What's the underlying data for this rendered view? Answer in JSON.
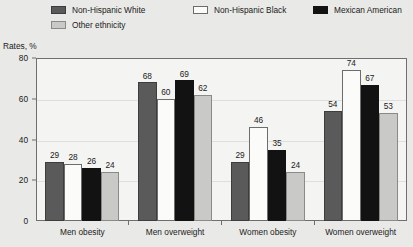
{
  "legend": {
    "items": [
      {
        "label": "Non-Hispanic White",
        "swatch": "dark-gray",
        "color": "#5a5a5a"
      },
      {
        "label": "Non-Hispanic Black",
        "swatch": "white",
        "color": "#fbfbfa"
      },
      {
        "label": "Mexican American",
        "swatch": "black",
        "color": "#121212"
      },
      {
        "label": "Other ethnicity",
        "swatch": "light-gray",
        "color": "#c9c9c7"
      }
    ]
  },
  "axis": {
    "y_title": "Rates, %",
    "y_ticks": [
      "0",
      "20",
      "40",
      "60",
      "80"
    ]
  },
  "chart_data": {
    "type": "bar",
    "title": "",
    "subtitle": "",
    "xlabel": "",
    "ylabel": "Rates, %",
    "ylim": [
      0,
      80
    ],
    "yticks": [
      0,
      20,
      40,
      60,
      80
    ],
    "grid": true,
    "legend_position": "top",
    "categories": [
      "Men obesity",
      "Men overweight",
      "Women obesity",
      "Women overweight"
    ],
    "series": [
      {
        "name": "Non-Hispanic White",
        "color": "#5a5a5a",
        "values": [
          29,
          68,
          29,
          54
        ]
      },
      {
        "name": "Non-Hispanic Black",
        "color": "#fbfbfa",
        "values": [
          28,
          60,
          46,
          74
        ]
      },
      {
        "name": "Mexican American",
        "color": "#121212",
        "values": [
          26,
          69,
          35,
          67
        ]
      },
      {
        "name": "Other ethnicity",
        "color": "#c9c9c7",
        "values": [
          24,
          62,
          24,
          53
        ]
      }
    ],
    "data_labels": [
      [
        "29",
        "28",
        "26",
        "24"
      ],
      [
        "68",
        "60",
        "69",
        "62"
      ],
      [
        "29",
        "46",
        "35",
        "24"
      ],
      [
        "54",
        "74",
        "67",
        "53"
      ]
    ]
  },
  "colors": {
    "page_background": "#e9e9e7",
    "plot_background": "#f4f4f2",
    "axis": "#6f6f6f",
    "gridline": "#dedede",
    "text": "#1a1a1a"
  }
}
